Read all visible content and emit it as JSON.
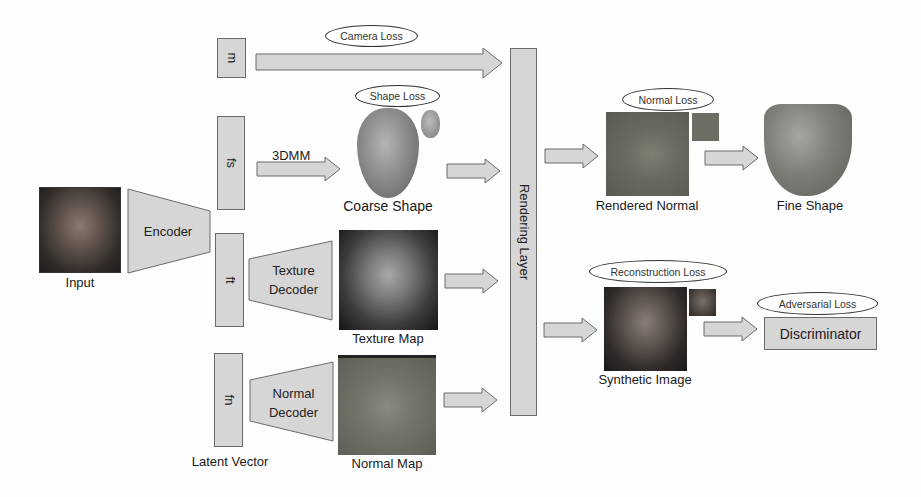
{
  "figure": {
    "input": {
      "label": "Input"
    },
    "encoder": {
      "label": "Encoder"
    },
    "latent": {
      "caption": "Latent Vector",
      "vectors": [
        {
          "id": "m",
          "label": "m"
        },
        {
          "id": "fs",
          "label": "fs"
        },
        {
          "id": "ft",
          "label": "ft"
        },
        {
          "id": "fn",
          "label": "fn"
        }
      ]
    },
    "threedmm": {
      "label": "3DMM"
    },
    "coarse_shape": {
      "label": "Coarse Shape",
      "loss": "Shape Loss"
    },
    "texture_decoder": {
      "line1": "Texture",
      "line2": "Decoder"
    },
    "texture_map": {
      "label": "Texture Map"
    },
    "normal_decoder": {
      "line1": "Normal",
      "line2": "Decoder"
    },
    "normal_map": {
      "label": "Normal Map"
    },
    "camera": {
      "loss": "Camera Loss"
    },
    "rendering_layer": {
      "label": "Rendering Layer"
    },
    "rendered_normal": {
      "label": "Rendered Normal",
      "loss": "Normal Loss"
    },
    "fine_shape": {
      "label": "Fine Shape"
    },
    "synthetic_image": {
      "label": "Synthetic Image",
      "loss": "Reconstruction Loss"
    },
    "discriminator": {
      "label": "Discriminator",
      "loss": "Adversarial Loss"
    }
  },
  "colors": {
    "box_fill": "#d6d6d6",
    "box_border": "#6a6a6a",
    "background": "#fefefe"
  }
}
